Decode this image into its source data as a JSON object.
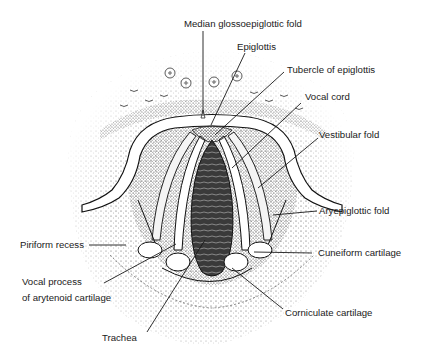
{
  "figure": {
    "colors": {
      "ink": "#1a1a1a",
      "background": "#ffffff",
      "stipple": "#555555",
      "lumen": "#2a2a2a"
    },
    "labels": {
      "median_glossoepiglottic_fold": "Median glossoepiglottic fold",
      "epiglottis": "Epiglottis",
      "tubercle_of_epiglottis": "Tubercle of epiglottis",
      "vocal_cord": "Vocal cord",
      "vestibular_fold": "Vestibular fold",
      "aryepiglottic_fold": "Aryepiglottic fold",
      "piriform_recess": "Piriform recess",
      "vocal_process_line1": "Vocal process",
      "vocal_process_line2": "of arytenoid cartilage",
      "cuneiform_cartilage": "Cuneiform cartilage",
      "corniculate_cartilage": "Corniculate cartilage",
      "trachea": "Trachea"
    }
  }
}
